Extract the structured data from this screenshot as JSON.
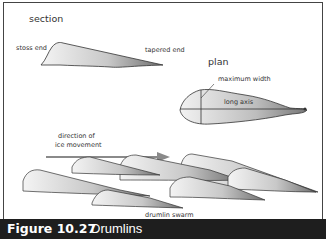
{
  "figure": {
    "number": "Figure 10.27",
    "title": "Drumlins"
  },
  "section": {
    "heading": "section",
    "labels": {
      "stoss_end": "stoss end",
      "tapered_end": "tapered end"
    }
  },
  "plan": {
    "heading": "plan",
    "labels": {
      "maximum_width": "maximum width",
      "long_axis": "long axis"
    }
  },
  "ice_movement": {
    "label_line1": "direction of",
    "label_line2": "ice movement"
  },
  "swarm": {
    "label": "drumlin swarm"
  },
  "colors": {
    "caption_bg": "#1e1e1e",
    "arrow": "#8a8a8a",
    "outline": "#333333"
  }
}
